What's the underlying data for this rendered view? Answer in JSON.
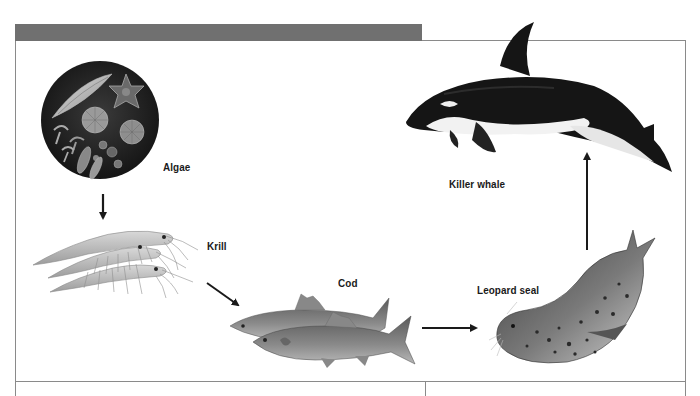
{
  "diagram": {
    "type": "food-chain",
    "header_bar_color": "#707070",
    "organisms": [
      {
        "id": "algae",
        "label": "Algae"
      },
      {
        "id": "krill",
        "label": "Krill"
      },
      {
        "id": "cod",
        "label": "Cod"
      },
      {
        "id": "leopard-seal",
        "label": "Leopard seal"
      },
      {
        "id": "killer-whale",
        "label": "Killer whale"
      }
    ],
    "arrows": [
      {
        "from": "algae",
        "to": "krill",
        "direction": "down"
      },
      {
        "from": "krill",
        "to": "cod",
        "direction": "down-right"
      },
      {
        "from": "cod",
        "to": "leopard-seal",
        "direction": "right"
      },
      {
        "from": "leopard-seal",
        "to": "killer-whale",
        "direction": "up"
      }
    ]
  }
}
